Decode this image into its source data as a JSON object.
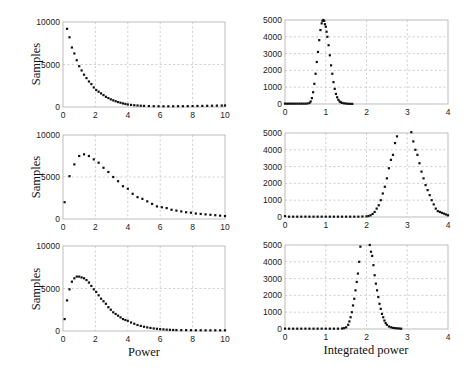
{
  "figure": {
    "left_xlabel": "Power",
    "right_xlabel": "Integrated power",
    "ylabel": "Samples"
  },
  "chart_data": [
    {
      "id": "left-top",
      "type": "scatter",
      "xlim": [
        0,
        10
      ],
      "ylim": [
        0,
        10000
      ],
      "xticks": [
        0,
        2,
        4,
        6,
        8,
        10
      ],
      "yticks": [
        0,
        5000,
        10000
      ],
      "ylabel": "Samples",
      "xlabel": "",
      "grid": true,
      "box": [
        63,
        22,
        225,
        107
      ],
      "x": [
        0.25,
        0.4,
        0.55,
        0.7,
        0.85,
        1.0,
        1.15,
        1.3,
        1.45,
        1.6,
        1.75,
        1.9,
        2.05,
        2.2,
        2.35,
        2.5,
        2.65,
        2.8,
        2.95,
        3.1,
        3.25,
        3.4,
        3.55,
        3.7,
        3.85,
        4.0,
        4.2,
        4.4,
        4.6,
        4.8,
        5.0,
        5.3,
        5.6,
        5.9,
        6.2,
        6.5,
        6.8,
        7.1,
        7.4,
        7.7,
        8.0,
        8.3,
        8.6,
        8.9,
        9.2,
        9.5,
        9.8,
        10.0
      ],
      "y": [
        9200,
        8200,
        7000,
        6300,
        5500,
        4800,
        4300,
        3800,
        3400,
        3000,
        2700,
        2300,
        2000,
        1800,
        1600,
        1400,
        1200,
        1050,
        900,
        780,
        680,
        580,
        500,
        420,
        360,
        300,
        250,
        210,
        180,
        150,
        130,
        110,
        95,
        85,
        80,
        80,
        85,
        90,
        95,
        100,
        110,
        120,
        130,
        140,
        150,
        160,
        170,
        180
      ]
    },
    {
      "id": "right-top",
      "type": "scatter",
      "xlim": [
        0,
        4
      ],
      "ylim": [
        0,
        5000
      ],
      "xticks": [
        0,
        1,
        2,
        3,
        4
      ],
      "yticks": [
        0,
        1000,
        2000,
        3000,
        4000,
        5000
      ],
      "ylabel": "",
      "xlabel": "",
      "grid": true,
      "box": [
        285,
        20,
        448,
        104
      ],
      "x": [
        0.0,
        0.05,
        0.1,
        0.15,
        0.2,
        0.25,
        0.3,
        0.35,
        0.4,
        0.45,
        0.5,
        0.55,
        0.6,
        0.63,
        0.66,
        0.69,
        0.72,
        0.75,
        0.78,
        0.81,
        0.84,
        0.87,
        0.9,
        0.92,
        0.94,
        0.96,
        0.98,
        1.0,
        1.02,
        1.04,
        1.07,
        1.1,
        1.13,
        1.16,
        1.19,
        1.22,
        1.25,
        1.28,
        1.31,
        1.34,
        1.37,
        1.4,
        1.45,
        1.5,
        1.55,
        1.6,
        1.65
      ],
      "y": [
        20,
        20,
        20,
        20,
        20,
        20,
        20,
        20,
        20,
        20,
        20,
        30,
        60,
        150,
        350,
        700,
        1200,
        1800,
        2500,
        3100,
        3800,
        4400,
        4800,
        4950,
        5000,
        4950,
        4750,
        4600,
        4300,
        4000,
        3500,
        2900,
        2300,
        1800,
        1300,
        900,
        600,
        400,
        250,
        150,
        100,
        70,
        40,
        25,
        15,
        10,
        5
      ]
    },
    {
      "id": "left-middle",
      "type": "scatter",
      "xlim": [
        0,
        10
      ],
      "ylim": [
        0,
        10000
      ],
      "xticks": [
        0,
        2,
        4,
        6,
        8,
        10
      ],
      "yticks": [
        0,
        5000,
        10000
      ],
      "ylabel": "Samples",
      "xlabel": "",
      "grid": true,
      "box": [
        63,
        135,
        225,
        219
      ],
      "x": [
        0.1,
        0.4,
        0.7,
        1.0,
        1.3,
        1.6,
        1.9,
        2.2,
        2.5,
        2.8,
        3.1,
        3.4,
        3.7,
        4.0,
        4.3,
        4.6,
        4.9,
        5.2,
        5.5,
        5.8,
        6.1,
        6.4,
        6.7,
        7.0,
        7.3,
        7.6,
        7.9,
        8.2,
        8.5,
        8.8,
        9.1,
        9.4,
        9.7,
        10.0
      ],
      "y": [
        2000,
        5100,
        6500,
        7500,
        7700,
        7500,
        7100,
        6700,
        6100,
        5600,
        5000,
        4500,
        3900,
        3600,
        3000,
        2600,
        2400,
        2100,
        1800,
        1500,
        1400,
        1300,
        1100,
        1000,
        900,
        800,
        750,
        650,
        600,
        550,
        500,
        450,
        400,
        350
      ]
    },
    {
      "id": "right-middle",
      "type": "scatter",
      "xlim": [
        0,
        4
      ],
      "ylim": [
        0,
        5000
      ],
      "xticks": [
        0,
        1,
        2,
        3,
        4
      ],
      "yticks": [
        0,
        1000,
        2000,
        3000,
        4000,
        5000
      ],
      "ylabel": "",
      "xlabel": "",
      "grid": true,
      "box": [
        285,
        133,
        448,
        217
      ],
      "x": [
        0.0,
        0.1,
        0.2,
        0.3,
        0.4,
        0.5,
        0.6,
        0.7,
        0.8,
        0.9,
        1.0,
        1.1,
        1.2,
        1.3,
        1.4,
        1.5,
        1.6,
        1.7,
        1.8,
        1.9,
        2.0,
        2.05,
        2.1,
        2.15,
        2.2,
        2.25,
        2.3,
        2.35,
        2.4,
        2.45,
        2.5,
        2.55,
        2.6,
        2.65,
        2.7,
        2.75,
        3.1,
        3.15,
        3.2,
        3.25,
        3.3,
        3.35,
        3.4,
        3.45,
        3.5,
        3.55,
        3.6,
        3.65,
        3.7,
        3.75,
        3.8,
        3.85,
        3.9,
        3.95,
        4.0
      ],
      "y": [
        50,
        20,
        20,
        20,
        20,
        20,
        20,
        20,
        20,
        20,
        20,
        20,
        20,
        20,
        20,
        20,
        20,
        20,
        20,
        30,
        40,
        60,
        100,
        180,
        300,
        500,
        700,
        1000,
        1400,
        1800,
        2300,
        2900,
        3400,
        3700,
        4400,
        4800,
        5050,
        4500,
        4000,
        3700,
        3200,
        2700,
        2300,
        1900,
        1600,
        1300,
        1000,
        750,
        500,
        350,
        300,
        250,
        200,
        150,
        100
      ]
    },
    {
      "id": "left-bottom",
      "type": "scatter",
      "xlim": [
        0,
        10
      ],
      "ylim": [
        0,
        10000
      ],
      "xticks": [
        0,
        2,
        4,
        6,
        8,
        10
      ],
      "yticks": [
        0,
        5000,
        10000
      ],
      "ylabel": "Samples",
      "xlabel": "Power",
      "grid": true,
      "box": [
        63,
        246,
        225,
        331
      ],
      "x": [
        0.1,
        0.25,
        0.4,
        0.55,
        0.7,
        0.85,
        1.0,
        1.15,
        1.3,
        1.45,
        1.6,
        1.75,
        1.9,
        2.05,
        2.2,
        2.35,
        2.5,
        2.65,
        2.8,
        2.95,
        3.1,
        3.25,
        3.4,
        3.55,
        3.7,
        3.85,
        4.0,
        4.2,
        4.4,
        4.6,
        4.8,
        5.0,
        5.2,
        5.4,
        5.6,
        5.8,
        6.0,
        6.2,
        6.4,
        6.6,
        6.8,
        7.0,
        7.3,
        7.6,
        7.9,
        8.2,
        8.5,
        8.8,
        9.1,
        9.4,
        9.7,
        10.0
      ],
      "y": [
        1400,
        3600,
        4900,
        5800,
        6200,
        6400,
        6400,
        6300,
        6200,
        6000,
        5700,
        5300,
        4900,
        4600,
        4200,
        3800,
        3500,
        3200,
        2800,
        2500,
        2200,
        2000,
        1800,
        1600,
        1400,
        1300,
        1200,
        1000,
        850,
        700,
        600,
        500,
        420,
        360,
        300,
        260,
        220,
        190,
        160,
        140,
        120,
        110,
        100,
        100,
        95,
        90,
        85,
        80,
        80,
        80,
        80,
        80
      ]
    },
    {
      "id": "right-bottom",
      "type": "scatter",
      "xlim": [
        0,
        4
      ],
      "ylim": [
        0,
        5000
      ],
      "xticks": [
        0,
        1,
        2,
        3,
        4
      ],
      "yticks": [
        0,
        1000,
        2000,
        3000,
        4000,
        5000
      ],
      "ylabel": "",
      "xlabel": "Integrated power",
      "grid": true,
      "box": [
        285,
        245,
        448,
        329
      ],
      "x": [
        0.0,
        0.1,
        0.2,
        0.3,
        0.4,
        0.5,
        0.6,
        0.7,
        0.8,
        0.9,
        1.0,
        1.1,
        1.2,
        1.3,
        1.4,
        1.45,
        1.5,
        1.55,
        1.58,
        1.61,
        1.64,
        1.67,
        1.7,
        1.73,
        1.76,
        1.79,
        1.82,
        1.85,
        2.08,
        2.11,
        2.14,
        2.17,
        2.2,
        2.23,
        2.26,
        2.29,
        2.32,
        2.35,
        2.38,
        2.41,
        2.44,
        2.47,
        2.5,
        2.55,
        2.6,
        2.65,
        2.7,
        2.75,
        2.8,
        2.85
      ],
      "y": [
        20,
        20,
        20,
        20,
        20,
        20,
        20,
        20,
        20,
        20,
        20,
        20,
        20,
        20,
        30,
        50,
        100,
        250,
        450,
        700,
        1000,
        1400,
        1800,
        2300,
        2800,
        3300,
        4000,
        4900,
        5000,
        4600,
        4350,
        3800,
        3200,
        2700,
        2300,
        1900,
        1500,
        1200,
        900,
        700,
        500,
        350,
        250,
        150,
        100,
        70,
        50,
        40,
        30,
        20
      ]
    }
  ]
}
